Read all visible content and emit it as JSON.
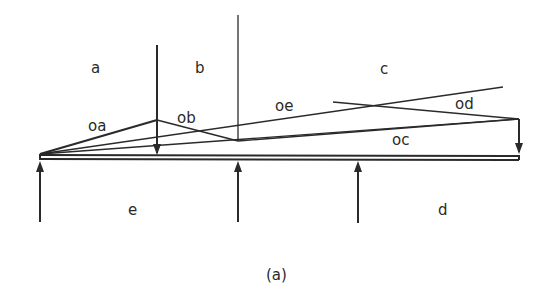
{
  "figure": {
    "caption": "(a)",
    "space_labels": {
      "a": "a",
      "b": "b",
      "c": "c",
      "d": "d",
      "e": "e"
    },
    "ray_labels": {
      "oa": "oa",
      "ob": "ob",
      "oc": "oc",
      "od": "od",
      "oe": "oe"
    }
  },
  "colors": {
    "ink": "#2a2a2a",
    "background": "#ffffff"
  }
}
